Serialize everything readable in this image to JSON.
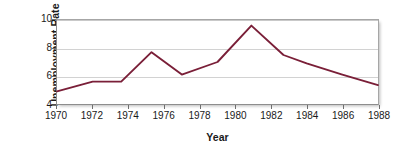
{
  "chart_data": {
    "type": "line",
    "title": "",
    "xlabel": "Year",
    "ylabel": "Unemployment Rate",
    "xlim": [
      1970,
      1988
    ],
    "ylim": [
      4,
      10
    ],
    "grid": true,
    "grid_axis": "y",
    "legend": "none",
    "line_color": "#7a1f38",
    "gridline_color": "#d2d2d2",
    "axis_color": "#8d8d8d",
    "background": "#ffffff",
    "xticks": [
      1970,
      1972,
      1974,
      1976,
      1978,
      1980,
      1982,
      1984,
      1986,
      1988
    ],
    "xtick_labels": [
      "1970",
      "1972",
      "1974",
      "1976",
      "1978",
      "1980",
      "1982",
      "1984",
      "1986",
      "1988"
    ],
    "yticks": [
      4,
      6,
      8,
      10
    ],
    "ytick_labels": [
      "4",
      "6",
      "8",
      "10"
    ],
    "series": [
      {
        "name": "Unemployment Rate",
        "color": "#7a1f38",
        "x": [
          1970,
          1972,
          1973.6,
          1975.3,
          1977,
          1979,
          1980.9,
          1982.7,
          1984,
          1986,
          1988
        ],
        "values": [
          4.9,
          5.6,
          5.6,
          7.7,
          6.1,
          7.0,
          9.6,
          7.5,
          6.9,
          6.1,
          5.35
        ]
      }
    ]
  }
}
